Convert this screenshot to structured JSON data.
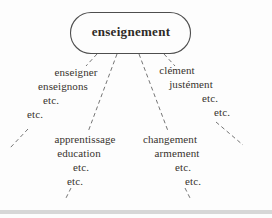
{
  "diagram": {
    "root": {
      "label": "enseignement"
    },
    "clusters": [
      {
        "name": "left-verb-forms",
        "lines": [
          "enseigner",
          "enseignons",
          "etc.",
          "etc."
        ]
      },
      {
        "name": "right-ment-words",
        "lines": [
          "clément",
          "justément",
          "etc.",
          "etc."
        ]
      },
      {
        "name": "bottom-left-related",
        "lines": [
          "apprentissage",
          "education",
          "etc.",
          "etc."
        ]
      },
      {
        "name": "bottom-right-ment-nouns",
        "lines": [
          "changement",
          "armement",
          "etc.",
          "etc."
        ]
      }
    ],
    "colors": {
      "background": "#fdfdfd",
      "text": "#38332e",
      "dashed_line": "#757575",
      "node_stroke": "#4e4e4e",
      "bottom_band": "#d7d7d7"
    }
  }
}
